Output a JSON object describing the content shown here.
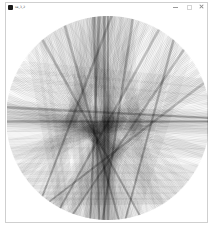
{
  "window": {
    "title": "sa_3_2",
    "controls": {
      "minimize": "minimize",
      "maximize": "maximize",
      "close": "close"
    }
  },
  "sketch": {
    "background": "#ffffff",
    "stroke_color": "#000000",
    "circle": {
      "cx": 101,
      "cy": 106,
      "r": 102
    },
    "chords_deg": [
      [
        262,
        95
      ],
      [
        265,
        100
      ],
      [
        268,
        92
      ],
      [
        270,
        88
      ],
      [
        258,
        104
      ],
      [
        275,
        98
      ],
      [
        280,
        96
      ],
      [
        284,
        93
      ],
      [
        255,
        108
      ],
      [
        290,
        110
      ],
      [
        295,
        102
      ],
      [
        300,
        118
      ],
      [
        305,
        112
      ],
      [
        310,
        120
      ],
      [
        315,
        125
      ],
      [
        320,
        130
      ],
      [
        325,
        140
      ],
      [
        330,
        148
      ],
      [
        335,
        150
      ],
      [
        340,
        155
      ],
      [
        345,
        158
      ],
      [
        350,
        160
      ],
      [
        355,
        165
      ],
      [
        0,
        170
      ],
      [
        5,
        175
      ],
      [
        10,
        178
      ],
      [
        15,
        182
      ],
      [
        20,
        186
      ],
      [
        25,
        190
      ],
      [
        178,
        2
      ],
      [
        182,
        358
      ],
      [
        186,
        0
      ],
      [
        240,
        80
      ],
      [
        245,
        84
      ],
      [
        250,
        86
      ],
      [
        235,
        78
      ],
      [
        230,
        72
      ],
      [
        225,
        68
      ],
      [
        220,
        62
      ],
      [
        215,
        58
      ],
      [
        210,
        55
      ],
      [
        205,
        50
      ],
      [
        200,
        46
      ],
      [
        195,
        40
      ],
      [
        190,
        35
      ],
      [
        185,
        30
      ],
      [
        300,
        85
      ],
      [
        310,
        80
      ],
      [
        320,
        75
      ],
      [
        260,
        120
      ],
      [
        265,
        125
      ],
      [
        272,
        130
      ],
      [
        278,
        135
      ],
      [
        285,
        140
      ],
      [
        292,
        145
      ],
      [
        298,
        150
      ],
      [
        232,
        110
      ],
      [
        228,
        115
      ],
      [
        222,
        118
      ],
      [
        200,
        350
      ],
      [
        205,
        345
      ],
      [
        210,
        340
      ],
      [
        160,
        20
      ],
      [
        165,
        15
      ],
      [
        150,
        30
      ],
      [
        145,
        35
      ],
      [
        140,
        40
      ],
      [
        135,
        45
      ],
      [
        130,
        50
      ],
      [
        125,
        55
      ],
      [
        270,
        60
      ],
      [
        275,
        65
      ],
      [
        280,
        70
      ],
      [
        262,
        88
      ],
      [
        263,
        90
      ],
      [
        264,
        87
      ],
      [
        266,
        94
      ],
      [
        308,
        100
      ],
      [
        312,
        104
      ],
      [
        318,
        110
      ],
      [
        238,
        100
      ],
      [
        242,
        96
      ],
      [
        248,
        92
      ],
      [
        252,
        90
      ],
      [
        176,
        4
      ],
      [
        180,
        6
      ],
      [
        184,
        8
      ],
      [
        200,
        20
      ],
      [
        330,
        115
      ],
      [
        335,
        120
      ],
      [
        340,
        125
      ],
      [
        60,
        230
      ],
      [
        55,
        235
      ],
      [
        50,
        240
      ],
      [
        45,
        245
      ],
      [
        40,
        250
      ],
      [
        75,
        255
      ],
      [
        80,
        260
      ],
      [
        85,
        265
      ],
      [
        90,
        270
      ],
      [
        95,
        275
      ],
      [
        100,
        280
      ],
      [
        105,
        285
      ],
      [
        110,
        290
      ]
    ],
    "stroke_alpha": 0.09,
    "stroke_width": 0.6,
    "emphasis_chords_deg": [
      [
        262,
        95
      ],
      [
        268,
        92
      ],
      [
        300,
        118
      ],
      [
        318,
        110
      ],
      [
        178,
        2
      ],
      [
        284,
        93
      ],
      [
        245,
        84
      ],
      [
        310,
        80
      ],
      [
        265,
        100
      ],
      [
        340,
        125
      ],
      [
        186,
        0
      ],
      [
        272,
        130
      ],
      [
        230,
        72
      ],
      [
        90,
        270
      ]
    ],
    "emphasis_alpha": 0.35
  }
}
